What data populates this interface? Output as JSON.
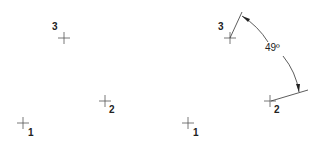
{
  "figure": {
    "left_panel": {
      "points": [
        {
          "label": "1",
          "x": 23,
          "y": 123
        },
        {
          "label": "2",
          "x": 105,
          "y": 101
        },
        {
          "label": "3",
          "x": 64,
          "y": 38
        }
      ]
    },
    "right_panel": {
      "points": [
        {
          "label": "1",
          "x": 188,
          "y": 123
        },
        {
          "label": "2",
          "x": 270,
          "y": 101
        },
        {
          "label": "3",
          "x": 230,
          "y": 38
        }
      ],
      "angle_dimension": {
        "value": "49º",
        "vertex_point": "1",
        "from_point": "3",
        "to_point": "2"
      }
    },
    "colors": {
      "line": "#333333",
      "text": "#222222",
      "background": "#ffffff"
    }
  }
}
